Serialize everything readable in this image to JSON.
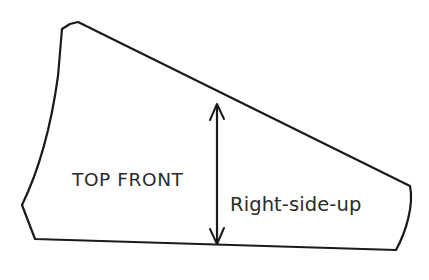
{
  "diagram": {
    "background_color": "#ffffff",
    "line_color": "#1a1a1a",
    "text_color": "#2b2b2b",
    "labels": {
      "piece_name": "TOP FRONT",
      "orientation_note": "Right-side-up"
    },
    "dimension_arrow": {
      "name": "height-dimension-arrow",
      "style": "double-headed vertical arrow",
      "x": 217,
      "y_top": 105,
      "y_bottom": 243
    },
    "outline": {
      "description": "Wedge-shaped pattern piece: small notch at top-left peak, concave curved left edge, near-horizontal bottom edge, slightly curved right edge, long straight diagonal top edge sloping down to the right",
      "points": [
        {
          "name": "notch-left",
          "x": 62,
          "y": 29
        },
        {
          "name": "notch-valley",
          "x": 70,
          "y": 24
        },
        {
          "name": "top-peak",
          "x": 78,
          "y": 22
        },
        {
          "name": "diagonal-end-right",
          "x": 410,
          "y": 186
        },
        {
          "name": "right-lower",
          "x": 396,
          "y": 250
        },
        {
          "name": "bottom-left-corner",
          "x": 35,
          "y": 239
        },
        {
          "name": "left-curve-base",
          "x": 22,
          "y": 205
        },
        {
          "name": "left-edge-top",
          "x": 58,
          "y": 76
        }
      ]
    }
  }
}
